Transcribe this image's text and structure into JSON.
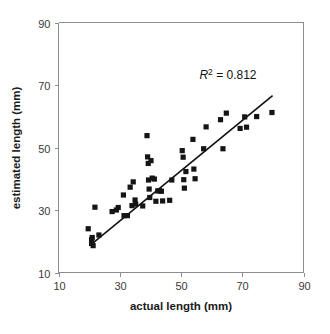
{
  "chart_data": {
    "type": "scatter",
    "title": "",
    "xlabel": "actual length (mm)",
    "ylabel": "estimated length (mm)",
    "xlim": [
      10,
      90
    ],
    "ylim": [
      10,
      90
    ],
    "xticks": [
      10,
      30,
      50,
      70,
      90
    ],
    "yticks": [
      10,
      30,
      50,
      70,
      90
    ],
    "xtick_labels": [
      "10",
      "30",
      "50",
      "70",
      "90"
    ],
    "ytick_labels": [
      "10",
      "30",
      "50",
      "70",
      "90"
    ],
    "grid": false,
    "legend": "none",
    "marker": "square",
    "marker_color": "#151515",
    "annotations": [
      {
        "name": "r-squared",
        "prefix": "R",
        "superscript": "2",
        "body": " = 0.812",
        "full_text": "R2 = 0.812",
        "x": 56,
        "y": 72
      }
    ],
    "fit_line": {
      "name": "regression-line",
      "x_start": 21.1,
      "y_start": 19.3,
      "x_end": 79.9,
      "y_end": 66.6,
      "color": "#111111"
    },
    "points": [
      {
        "x": 19.7,
        "y": 24.0
      },
      {
        "x": 20.8,
        "y": 20.5
      },
      {
        "x": 20.8,
        "y": 19.3
      },
      {
        "x": 21.0,
        "y": 21.2
      },
      {
        "x": 21.3,
        "y": 18.6
      },
      {
        "x": 21.9,
        "y": 30.9
      },
      {
        "x": 23.2,
        "y": 22.0
      },
      {
        "x": 27.5,
        "y": 29.5
      },
      {
        "x": 28.9,
        "y": 30.0
      },
      {
        "x": 29.5,
        "y": 30.8
      },
      {
        "x": 31.2,
        "y": 34.8
      },
      {
        "x": 31.4,
        "y": 28.2
      },
      {
        "x": 32.5,
        "y": 28.2
      },
      {
        "x": 33.4,
        "y": 37.3
      },
      {
        "x": 34.0,
        "y": 31.4
      },
      {
        "x": 34.4,
        "y": 39.0
      },
      {
        "x": 35.0,
        "y": 33.2
      },
      {
        "x": 35.2,
        "y": 31.9
      },
      {
        "x": 37.5,
        "y": 31.3
      },
      {
        "x": 38.9,
        "y": 53.8
      },
      {
        "x": 39.1,
        "y": 47.0
      },
      {
        "x": 39.3,
        "y": 44.9
      },
      {
        "x": 39.4,
        "y": 39.6
      },
      {
        "x": 39.6,
        "y": 36.7
      },
      {
        "x": 39.8,
        "y": 34.0
      },
      {
        "x": 40.2,
        "y": 45.8
      },
      {
        "x": 40.6,
        "y": 40.2
      },
      {
        "x": 41.3,
        "y": 39.9
      },
      {
        "x": 41.8,
        "y": 32.8
      },
      {
        "x": 42.4,
        "y": 36.1
      },
      {
        "x": 43.0,
        "y": 36.2
      },
      {
        "x": 43.6,
        "y": 36.0
      },
      {
        "x": 44.0,
        "y": 32.9
      },
      {
        "x": 46.3,
        "y": 33.1
      },
      {
        "x": 47.0,
        "y": 39.6
      },
      {
        "x": 50.4,
        "y": 49.0
      },
      {
        "x": 50.7,
        "y": 46.9
      },
      {
        "x": 50.9,
        "y": 39.7
      },
      {
        "x": 51.1,
        "y": 37.0
      },
      {
        "x": 51.6,
        "y": 42.3
      },
      {
        "x": 53.9,
        "y": 52.6
      },
      {
        "x": 54.2,
        "y": 43.1
      },
      {
        "x": 54.6,
        "y": 40.0
      },
      {
        "x": 57.4,
        "y": 49.6
      },
      {
        "x": 58.2,
        "y": 56.6
      },
      {
        "x": 62.9,
        "y": 58.9
      },
      {
        "x": 63.7,
        "y": 49.6
      },
      {
        "x": 64.8,
        "y": 61.0
      },
      {
        "x": 69.3,
        "y": 56.1
      },
      {
        "x": 70.8,
        "y": 59.8
      },
      {
        "x": 71.4,
        "y": 56.5
      },
      {
        "x": 74.7,
        "y": 59.9
      },
      {
        "x": 79.7,
        "y": 61.2
      }
    ]
  }
}
